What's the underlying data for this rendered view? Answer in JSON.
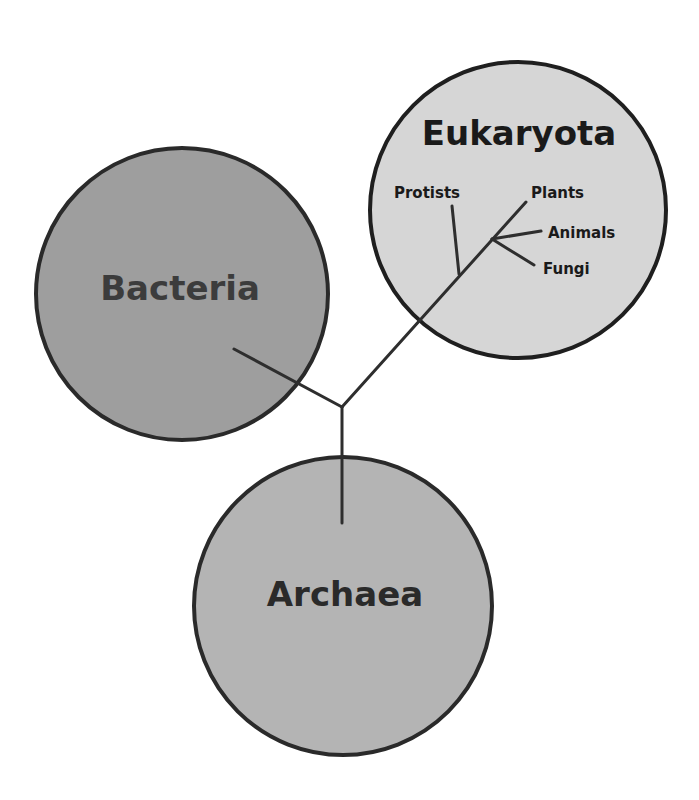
{
  "diagram": {
    "colors": {
      "background": "#ffffff",
      "outline": "#2a2a2a",
      "branch": "#2e2e2e",
      "bacteria_fill": "#9e9e9e",
      "archaea_fill": "#b4b4b4",
      "eukaryota_fill": "#d6d6d6",
      "bacteria_text": "#3c3c3c",
      "archaea_text": "#2a2a2a",
      "eukaryota_text": "#1a1a1a"
    },
    "domains": [
      {
        "name": "Bacteria",
        "cx": 182,
        "cy": 294,
        "r": 146
      },
      {
        "name": "Archaea",
        "cx": 343,
        "cy": 606,
        "r": 149
      },
      {
        "name": "Eukaryota",
        "cx": 518,
        "cy": 210,
        "r": 148
      }
    ],
    "eukaryota_groups": [
      {
        "name": "Protists"
      },
      {
        "name": "Plants"
      },
      {
        "name": "Animals"
      },
      {
        "name": "Fungi"
      }
    ],
    "tree": {
      "root_junction": {
        "x": 342,
        "y": 407
      }
    }
  }
}
